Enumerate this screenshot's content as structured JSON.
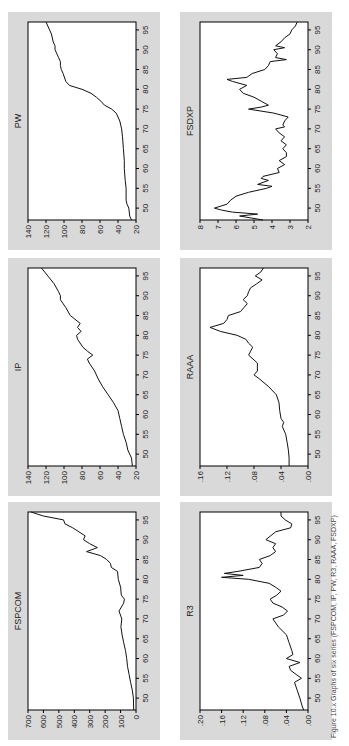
{
  "figure": {
    "caption": "Figure 10.x Graphs of six series (FSPCOM, IP, PW, R3, RAAA, FSDXP)"
  },
  "chart_data": [
    {
      "type": "line",
      "title": "FSPCOM",
      "xlabel": "",
      "ylabel": "",
      "xlim": [
        47,
        97
      ],
      "ylim": [
        0,
        700
      ],
      "xticks": [
        "50",
        "55",
        "60",
        "65",
        "70",
        "75",
        "80",
        "85",
        "90",
        "95"
      ],
      "yticks": [
        "0",
        "100",
        "200",
        "300",
        "400",
        "500",
        "600",
        "700"
      ],
      "x": [
        47,
        50,
        52,
        54,
        56,
        58,
        60,
        62,
        64,
        66,
        68,
        70,
        72,
        74,
        75,
        76,
        78,
        80,
        82,
        83,
        84,
        85,
        86,
        87,
        88,
        89,
        90,
        91,
        92,
        93,
        94,
        95,
        96,
        97
      ],
      "values": [
        15,
        17,
        24,
        35,
        45,
        55,
        60,
        68,
        80,
        90,
        98,
        92,
        110,
        80,
        75,
        95,
        100,
        115,
        120,
        160,
        165,
        190,
        230,
        320,
        250,
        300,
        340,
        330,
        370,
        410,
        460,
        470,
        600,
        680
      ]
    },
    {
      "type": "line",
      "title": "IP",
      "xlabel": "",
      "ylabel": "",
      "xlim": [
        47,
        97
      ],
      "ylim": [
        20,
        140
      ],
      "xticks": [
        "50",
        "55",
        "60",
        "65",
        "70",
        "75",
        "80",
        "85",
        "90",
        "95"
      ],
      "yticks": [
        "20",
        "40",
        "60",
        "80",
        "100",
        "120",
        "140"
      ],
      "x": [
        47,
        49,
        51,
        53,
        55,
        57,
        59,
        61,
        63,
        65,
        67,
        69,
        71,
        73,
        74,
        75,
        76,
        77,
        79,
        80,
        81,
        82,
        83,
        85,
        87,
        89,
        90,
        91,
        93,
        95,
        97
      ],
      "values": [
        24,
        25,
        29,
        31,
        34,
        36,
        38,
        40,
        45,
        51,
        57,
        62,
        66,
        72,
        74,
        68,
        74,
        79,
        85,
        86,
        81,
        85,
        82,
        93,
        98,
        104,
        104,
        106,
        111,
        118,
        125
      ]
    },
    {
      "type": "line",
      "title": "PW",
      "xlabel": "",
      "ylabel": "",
      "xlim": [
        47,
        97
      ],
      "ylim": [
        20,
        140
      ],
      "xticks": [
        "50",
        "55",
        "60",
        "65",
        "70",
        "75",
        "80",
        "85",
        "90",
        "95"
      ],
      "yticks": [
        "20",
        "40",
        "60",
        "80",
        "100",
        "120",
        "140"
      ],
      "x": [
        47,
        48,
        50,
        51,
        52,
        55,
        57,
        60,
        62,
        65,
        68,
        70,
        72,
        73,
        74,
        75,
        76,
        77,
        78,
        79,
        80,
        81,
        82,
        84,
        85,
        86,
        87,
        88,
        90,
        91,
        92,
        94,
        96,
        97
      ],
      "values": [
        25,
        27,
        28,
        30,
        31,
        31,
        32,
        33,
        33,
        34,
        35,
        36,
        38,
        40,
        42,
        47,
        55,
        59,
        64,
        70,
        80,
        94,
        98,
        101,
        103,
        104,
        104,
        106,
        110,
        110,
        112,
        114,
        118,
        120
      ]
    },
    {
      "type": "line",
      "title": "R3",
      "xlabel": "",
      "ylabel": "",
      "xlim": [
        47,
        97
      ],
      "ylim": [
        0.0,
        0.2
      ],
      "xticks": [
        "50",
        "55",
        "60",
        "65",
        "70",
        "75",
        "80",
        "85",
        "90",
        "95"
      ],
      "yticks": [
        ".00",
        ".04",
        ".08",
        ".12",
        ".16",
        ".20"
      ],
      "x": [
        47,
        48,
        50,
        52,
        54,
        55,
        56,
        57,
        58,
        59,
        60,
        61,
        62,
        64,
        66,
        68,
        70,
        71,
        72,
        73,
        74,
        75,
        76,
        77,
        78,
        79,
        80,
        80.5,
        81,
        81.5,
        82,
        83,
        84,
        85,
        86,
        87,
        88,
        89,
        90,
        92,
        93,
        94,
        95,
        96,
        97
      ],
      "values": [
        0.008,
        0.011,
        0.015,
        0.02,
        0.025,
        0.012,
        0.022,
        0.032,
        0.035,
        0.015,
        0.04,
        0.028,
        0.03,
        0.035,
        0.04,
        0.055,
        0.065,
        0.045,
        0.038,
        0.048,
        0.065,
        0.07,
        0.058,
        0.05,
        0.06,
        0.072,
        0.11,
        0.16,
        0.12,
        0.155,
        0.13,
        0.09,
        0.085,
        0.09,
        0.07,
        0.06,
        0.065,
        0.06,
        0.078,
        0.06,
        0.032,
        0.03,
        0.042,
        0.05,
        0.05
      ]
    },
    {
      "type": "line",
      "title": "RAAA",
      "xlabel": "",
      "ylabel": "",
      "xlim": [
        47,
        97
      ],
      "ylim": [
        0.0,
        0.16
      ],
      "xticks": [
        "50",
        "55",
        "60",
        "65",
        "70",
        "75",
        "80",
        "85",
        "90",
        "95"
      ],
      "yticks": [
        ".00",
        ".04",
        ".08",
        ".12",
        ".16"
      ],
      "x": [
        47,
        49,
        51,
        53,
        55,
        57,
        58,
        59,
        61,
        63,
        65,
        67,
        69,
        70,
        71,
        73,
        75,
        76,
        77,
        78,
        79,
        80,
        81,
        82,
        83,
        84,
        85,
        86,
        87,
        88,
        89,
        90,
        91,
        92,
        93,
        94,
        95,
        96,
        97
      ],
      "values": [
        0.028,
        0.028,
        0.029,
        0.031,
        0.033,
        0.038,
        0.036,
        0.04,
        0.042,
        0.043,
        0.047,
        0.058,
        0.072,
        0.08,
        0.075,
        0.075,
        0.088,
        0.085,
        0.082,
        0.088,
        0.092,
        0.105,
        0.13,
        0.145,
        0.125,
        0.12,
        0.118,
        0.1,
        0.095,
        0.09,
        0.096,
        0.09,
        0.088,
        0.085,
        0.076,
        0.068,
        0.078,
        0.07,
        0.066
      ]
    },
    {
      "type": "line",
      "title": "FSDXP",
      "xlabel": "",
      "ylabel": "",
      "xlim": [
        47,
        97
      ],
      "ylim": [
        2,
        8
      ],
      "xticks": [
        "50",
        "55",
        "60",
        "65",
        "70",
        "75",
        "80",
        "85",
        "90",
        "95"
      ],
      "yticks": [
        "2",
        "3",
        "4",
        "5",
        "6",
        "7",
        "8"
      ],
      "x": [
        47,
        48,
        48.5,
        49,
        49.5,
        50,
        51,
        52,
        53,
        54,
        55,
        55.5,
        56,
        57,
        57.5,
        58,
        59,
        60,
        61,
        62,
        63,
        64,
        65,
        66,
        67,
        68,
        69,
        70,
        70.5,
        71,
        72,
        73,
        74,
        75,
        75.5,
        76,
        77,
        78,
        79,
        80,
        81,
        82,
        82.5,
        83,
        84,
        85,
        86,
        87,
        87.5,
        88,
        89,
        90,
        90.5,
        91,
        92,
        93,
        94,
        95,
        96,
        97
      ],
      "values": [
        4.5,
        5.8,
        4.8,
        6.2,
        6.8,
        7.2,
        6.5,
        6.3,
        6.0,
        5.3,
        4.3,
        4.0,
        4.8,
        4.2,
        4.6,
        4.5,
        3.6,
        3.7,
        3.3,
        3.6,
        3.2,
        3.2,
        3.4,
        3.2,
        3.5,
        3.3,
        3.6,
        3.8,
        3.3,
        3.4,
        3.3,
        3.1,
        3.9,
        5.3,
        4.6,
        4.2,
        4.6,
        5.0,
        5.6,
        5.8,
        5.4,
        6.2,
        6.5,
        5.4,
        5.1,
        4.4,
        4.2,
        4.1,
        3.2,
        3.8,
        3.7,
        3.9,
        3.3,
        3.8,
        3.5,
        3.3,
        3.0,
        2.9,
        2.7,
        2.6
      ]
    }
  ]
}
